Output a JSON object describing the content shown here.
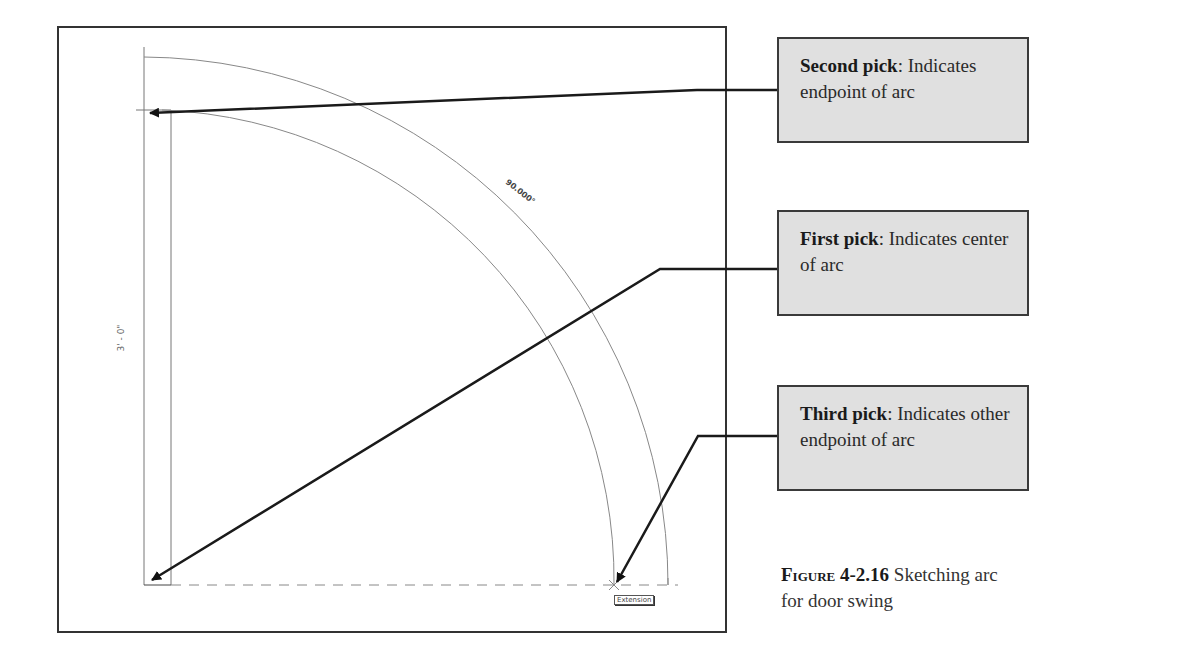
{
  "figure": {
    "number": "4-2.16",
    "label": "Figure",
    "caption": "Sketching arc for door swing"
  },
  "drawing": {
    "angle_dimension": "90.000°",
    "length_dimension": "3' - 0\"",
    "snap_tooltip": "Extension"
  },
  "callouts": [
    {
      "title": "Second pick",
      "text": ": Indicates endpoint of arc"
    },
    {
      "title": "First pick",
      "text": ": Indicates center of arc"
    },
    {
      "title": "Third pick",
      "text": ": Indicates other endpoint of arc"
    }
  ],
  "colors": {
    "callout_bg": "#e0e0e0",
    "callout_border": "#3a3a3a",
    "line": "#1a1a1a",
    "drawing_line": "#777777"
  }
}
